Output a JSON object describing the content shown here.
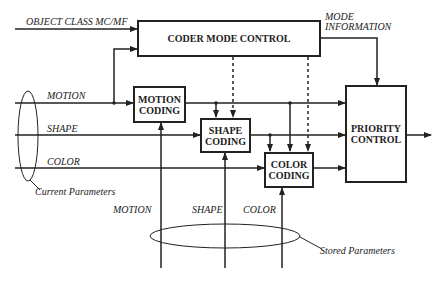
{
  "blocks": {
    "coder_mode_control": "CODER MODE CONTROL",
    "motion_coding": "MOTION\nCODING",
    "shape_coding": "SHAPE\nCODING",
    "color_coding": "COLOR\nCODING",
    "priority_control": "PRIORITY\nCONTROL"
  },
  "labels": {
    "object_class": "OBJECT CLASS MC/MF",
    "mode_information_1": "MODE",
    "mode_information_2": "INFORMATION",
    "motion_in": "MOTION",
    "shape_in": "SHAPE",
    "color_in": "COLOR",
    "current_parameters": "Current Parameters",
    "motion_stored": "MOTION",
    "shape_stored": "SHAPE",
    "color_stored": "COLOR",
    "stored_parameters": "Stored Parameters"
  }
}
